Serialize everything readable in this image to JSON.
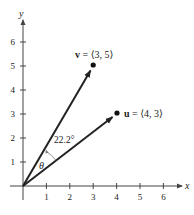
{
  "axes": {
    "x_label": "x",
    "y_label": "y",
    "x_ticks": [
      "1",
      "2",
      "3",
      "4",
      "5",
      "6"
    ],
    "y_ticks": [
      "1",
      "2",
      "3",
      "4",
      "5",
      "6"
    ]
  },
  "vectors": [
    {
      "name": "v",
      "label_bold": "v",
      "label_rest": " = ⟨3, 5⟩",
      "x": 3,
      "y": 5
    },
    {
      "name": "u",
      "label_bold": "u",
      "label_rest": " = ⟨4, 3⟩",
      "x": 4,
      "y": 3
    }
  ],
  "angle": {
    "symbol": "θ",
    "value_label": "22.2°"
  },
  "colors": {
    "ink": "#222222"
  }
}
